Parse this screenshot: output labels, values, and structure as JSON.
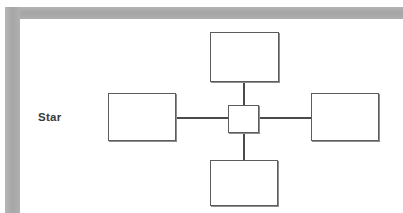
{
  "page": {
    "background_color": "#ffffff",
    "frame_color": "#a9a9a9",
    "width": 403,
    "height": 213
  },
  "diagram": {
    "caption": "Star",
    "type": "network-topology",
    "topology_name": "Star",
    "line_color": "#4a4a4a",
    "node_border_color": "#5c5c5c",
    "node_fill_color": "#ffffff",
    "hub": {
      "name": "central-hub-node",
      "label": ""
    },
    "nodes": [
      {
        "name": "top-node",
        "position": "top",
        "label": ""
      },
      {
        "name": "left-node",
        "position": "left",
        "label": ""
      },
      {
        "name": "right-node",
        "position": "right",
        "label": ""
      },
      {
        "name": "bottom-node",
        "position": "bottom",
        "label": ""
      }
    ],
    "links": [
      {
        "name": "hub-to-top-link",
        "from": "hub",
        "to": "top-node",
        "orientation": "vertical"
      },
      {
        "name": "hub-to-bottom-link",
        "from": "hub",
        "to": "bottom-node",
        "orientation": "vertical"
      },
      {
        "name": "hub-to-left-link",
        "from": "hub",
        "to": "left-node",
        "orientation": "horizontal"
      },
      {
        "name": "hub-to-right-link",
        "from": "hub",
        "to": "right-node",
        "orientation": "horizontal"
      }
    ]
  }
}
